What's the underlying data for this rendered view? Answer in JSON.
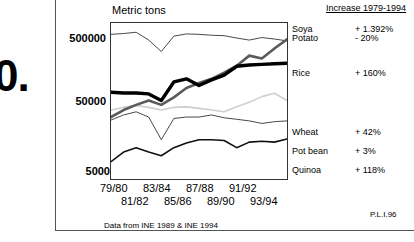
{
  "slide": {
    "number_fragment": "0.",
    "footnote": "Data from INE 1989 & INE 1994",
    "credit": "P.L.I.96"
  },
  "legend": {
    "header": "Increase 1979-1994",
    "entries": [
      {
        "label": "Soya",
        "change": "+ 1.392%"
      },
      {
        "label": "Potato",
        "change": "- 20%"
      },
      {
        "label": "Rice",
        "change": "+ 160%"
      },
      {
        "label": "Wheat",
        "change": "+ 42%"
      },
      {
        "label": "Pot bean",
        "change": "+ 3%"
      },
      {
        "label": "Quinoa",
        "change": "+ 118%"
      }
    ]
  },
  "chart_data": {
    "type": "line",
    "title": "Metric tons",
    "xlabel": "",
    "ylabel": "Metric tons",
    "yscale": "log",
    "ylim": [
      5000,
      1000000
    ],
    "ytick_labels": [
      "500000",
      "50000",
      "5000"
    ],
    "ytick_values": [
      500000,
      50000,
      5000
    ],
    "grid": false,
    "legend_position": "right-of-plot",
    "categories": [
      "79/80",
      "80/81",
      "81/82",
      "82/83",
      "83/84",
      "84/85",
      "85/86",
      "86/87",
      "87/88",
      "88/89",
      "89/90",
      "90/91",
      "91/92",
      "92/93",
      "93/94"
    ],
    "x_tick_labels_row_a": [
      "79/80",
      "83/84",
      "87/88",
      "91/92"
    ],
    "x_tick_labels_row_b": [
      "81/82",
      "85/86",
      "89/90",
      "93/94"
    ],
    "series": [
      {
        "name": "Potato",
        "style": "thin-black",
        "values": [
          680000,
          700000,
          730000,
          560000,
          380000,
          640000,
          690000,
          680000,
          660000,
          650000,
          600000,
          560000,
          610000,
          580000,
          545000
        ]
      },
      {
        "name": "Soya",
        "style": "medium-gray",
        "values": [
          41000,
          52000,
          62000,
          72000,
          62000,
          80000,
          110000,
          130000,
          150000,
          185000,
          235000,
          330000,
          300000,
          420000,
          575000
        ]
      },
      {
        "name": "Rice",
        "style": "thick-black",
        "values": [
          95000,
          93000,
          93000,
          90000,
          72000,
          135000,
          150000,
          120000,
          145000,
          170000,
          230000,
          240000,
          245000,
          250000,
          255000
        ]
      },
      {
        "name": "Wheat",
        "style": "light-gray",
        "values": [
          52000,
          57000,
          61000,
          57000,
          52000,
          57000,
          58000,
          55000,
          52000,
          49000,
          58000,
          68000,
          82000,
          92000,
          72000
        ]
      },
      {
        "name": "Pot bean",
        "style": "thin-black-2",
        "values": [
          37000,
          44000,
          49000,
          41000,
          19000,
          39000,
          41000,
          41000,
          44000,
          40000,
          38000,
          36000,
          33000,
          35000,
          36000
        ]
      },
      {
        "name": "Quinoa",
        "style": "medium-black",
        "values": [
          9000,
          12500,
          14500,
          12500,
          11000,
          14500,
          17000,
          19000,
          19000,
          18500,
          14500,
          17500,
          18000,
          17500,
          19500
        ]
      }
    ]
  }
}
